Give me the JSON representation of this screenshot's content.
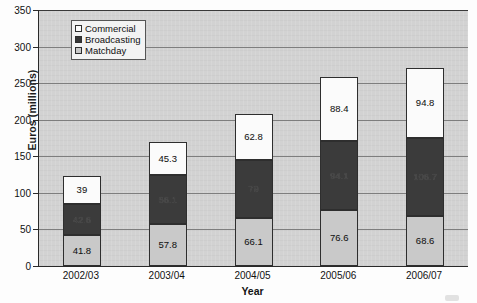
{
  "chart_data": {
    "type": "bar",
    "subtype": "stacked-bar",
    "title": "",
    "xlabel": "Year",
    "ylabel": "Euros (millions)",
    "ylim": [
      0,
      350
    ],
    "ytick_step": 50,
    "yticks": [
      0,
      50,
      100,
      150,
      200,
      250,
      300,
      350
    ],
    "grid": true,
    "legend_position": "top-left-inside",
    "categories": [
      "2002/03",
      "2003/04",
      "2004/05",
      "2005/06",
      "2006/07"
    ],
    "series": [
      {
        "name": "Matchday",
        "color": "#c9c9c9",
        "values": [
          41.8,
          57.8,
          66.1,
          76.6,
          68.6
        ]
      },
      {
        "name": "Broadcasting",
        "color": "#3b3b3b",
        "values": [
          42.6,
          66.1,
          79,
          94.1,
          106.7
        ]
      },
      {
        "name": "Commercial",
        "color": "#fbfbfb",
        "values": [
          39,
          45.3,
          62.8,
          88.4,
          94.8
        ]
      }
    ],
    "stack_order_bottom_to_top": [
      "Matchday",
      "Broadcasting",
      "Commercial"
    ],
    "totals": [
      123.4,
      169.2,
      207.9,
      259.1,
      270.1
    ]
  },
  "legend": {
    "items": [
      {
        "label": "Commercial",
        "swatch": "commercial"
      },
      {
        "label": "Broadcasting",
        "swatch": "broadcasting"
      },
      {
        "label": "Matchday",
        "swatch": "matchday"
      }
    ]
  },
  "axes": {
    "y_title": "Euros (millions)",
    "x_title": "Year",
    "y_tick_labels": [
      "350",
      "300",
      "250",
      "200",
      "150",
      "100",
      "50",
      "0"
    ],
    "x_tick_labels": [
      "2002/03",
      "2003/04",
      "2004/05",
      "2005/06",
      "2006/07"
    ]
  },
  "bar_labels": [
    {
      "category": "2002/03",
      "matchday": "41.8",
      "broadcasting": "42.6",
      "commercial": "39"
    },
    {
      "category": "2003/04",
      "matchday": "57.8",
      "broadcasting": "66.1",
      "commercial": "45.3"
    },
    {
      "category": "2004/05",
      "matchday": "66.1",
      "broadcasting": "79",
      "commercial": "62.8"
    },
    {
      "category": "2005/06",
      "matchday": "76.6",
      "broadcasting": "94.1",
      "commercial": "88.4"
    },
    {
      "category": "2006/07",
      "matchday": "68.6",
      "broadcasting": "106.7",
      "commercial": "94.8"
    }
  ],
  "colors": {
    "plot_background": "#d2d2d2",
    "axis": "#2a2a2a",
    "gridline": "#7e7e7e",
    "commercial": "#fbfbfb",
    "broadcasting": "#3b3b3b",
    "matchday": "#c9c9c9"
  }
}
